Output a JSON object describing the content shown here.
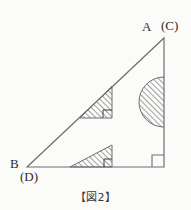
{
  "figure": {
    "caption": "【図2】",
    "vertices": {
      "apex_label": "A",
      "apex_alt_label": "(C)",
      "left_label": "B",
      "left_alt_label": "(D)",
      "right_angle_corner": "bottom-right"
    },
    "colors": {
      "background": "#fbfbfa",
      "stroke": "#6e6e6e",
      "hatch": "#555555",
      "text": "#2b2b2b"
    },
    "geometry": {
      "triangle_points": "27,167 164,38 164,167",
      "upper_hatched_triangle": "80,118 112,86 112,118",
      "lower_hatched_triangle": "70,167 112,145 112,167",
      "semicircle_center_x": 164,
      "semicircle_center_y": 102,
      "semicircle_radius": 25,
      "right_angle_mark_main": "152,167 152,155 164,155",
      "right_angle_mark_upper": "103,118 103,110 112,110",
      "right_angle_mark_lower": "104,167 104,159 112,159"
    }
  }
}
